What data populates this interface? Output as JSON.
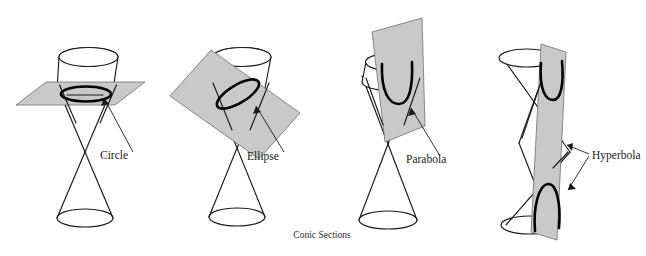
{
  "figure": {
    "caption": "Conic Sections",
    "background_color": "#ffffff",
    "line_color": "#1a1a1a",
    "curve_color": "#000000",
    "plane_fill_color": "#c9c9c9",
    "plane_stroke_color": "#6e6e6e"
  },
  "panels": [
    {
      "id": "circle",
      "label": "Circle",
      "cutting_plane": "horizontal",
      "description": "Plane perpendicular to the cone axis cuts the upper nappe in a circle."
    },
    {
      "id": "ellipse",
      "label": "Ellipse",
      "cutting_plane": "oblique",
      "description": "Plane tilted but cutting only one nappe produces an ellipse."
    },
    {
      "id": "parabola",
      "label": "Parabola",
      "cutting_plane": "parallel-to-slant",
      "description": "Plane parallel to a generating line of the cone produces a parabola."
    },
    {
      "id": "hyperbola",
      "label": "Hyperbola",
      "cutting_plane": "vertical",
      "description": "Plane cutting both nappes produces a hyperbola with two branches."
    }
  ]
}
